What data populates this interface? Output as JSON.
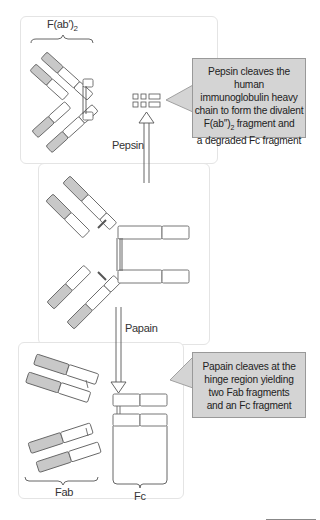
{
  "diagram": {
    "colors": {
      "variable_domain": "#c8c8c8",
      "constant_domain": "#ffffff",
      "outline": "#666666",
      "callout_fill": "#d4d4d4",
      "callout_border": "#999999",
      "panel_border": "#e4e4e4"
    },
    "top_panel": {
      "bracket_label": "F(ab′)",
      "bracket_label_sub": "2",
      "arrow_label": "Pepsin"
    },
    "pepsin_callout": {
      "line1": "Pepsin cleaves the human",
      "line2": "immunoglobulin heavy",
      "line3": "chain to form the divalent",
      "line4_main": "F(ab″)",
      "line4_sub": "2",
      "line4_rest": " fragment and",
      "line5": "a degraded Fc fragment"
    },
    "middle_panel": {
      "arrow_label": "Papain"
    },
    "bottom_panel": {
      "fab_label": "Fab",
      "fc_label": "Fc"
    },
    "papain_callout": {
      "line1": "Papain cleaves at the",
      "line2": "hinge region yielding",
      "line3": "two Fab fragments",
      "line4": "and an Fc fragment"
    }
  }
}
